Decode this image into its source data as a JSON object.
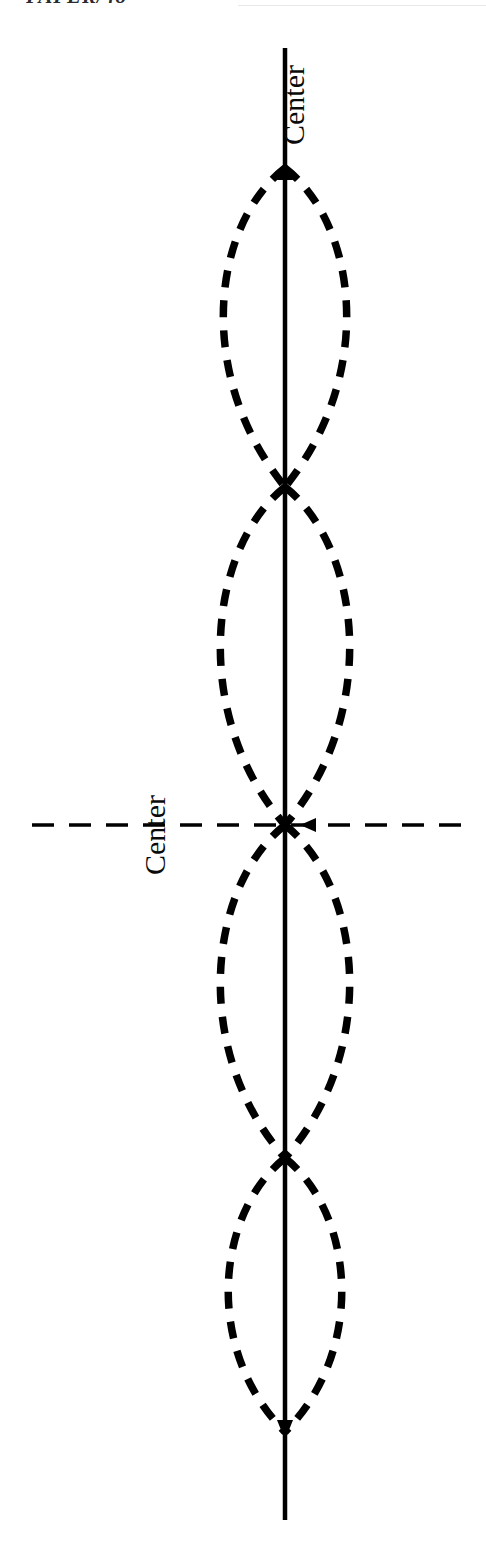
{
  "header": {
    "title": "PAPER/48",
    "rule_color": "#e8e8e8"
  },
  "figure": {
    "name": "standing-wave-mode-diagram",
    "background": "#ffffff",
    "stroke_color": "#000000",
    "labels": {
      "vertical_center": "Center",
      "horizontal_center": "Center"
    },
    "axes": {
      "vertical_line": {
        "x": 285,
        "y_top": 48,
        "y_bottom": 1520,
        "width": 4.5,
        "style": "solid",
        "arrow_top_y": 168,
        "arrow_bottom_y": 1432
      },
      "horizontal_line": {
        "y": 825,
        "x_left": 32,
        "x_right": 470,
        "width": 3.5,
        "style": "dashed",
        "dash": "22 15",
        "arrow_left_x": 300
      }
    },
    "nodes_y": [
      168,
      487,
      825,
      1158,
      1432
    ],
    "lobes": [
      {
        "index": 1,
        "y_top": 168,
        "y_bottom": 487,
        "half_width": 91
      },
      {
        "index": 2,
        "y_top": 487,
        "y_bottom": 825,
        "half_width": 93
      },
      {
        "index": 3,
        "y_top": 825,
        "y_bottom": 1158,
        "half_width": 93
      },
      {
        "index": 4,
        "y_top": 1158,
        "y_bottom": 1432,
        "half_width": 84
      }
    ],
    "curve_style": {
      "dash": "17 13",
      "width": 7.5,
      "linecap": "butt"
    }
  }
}
